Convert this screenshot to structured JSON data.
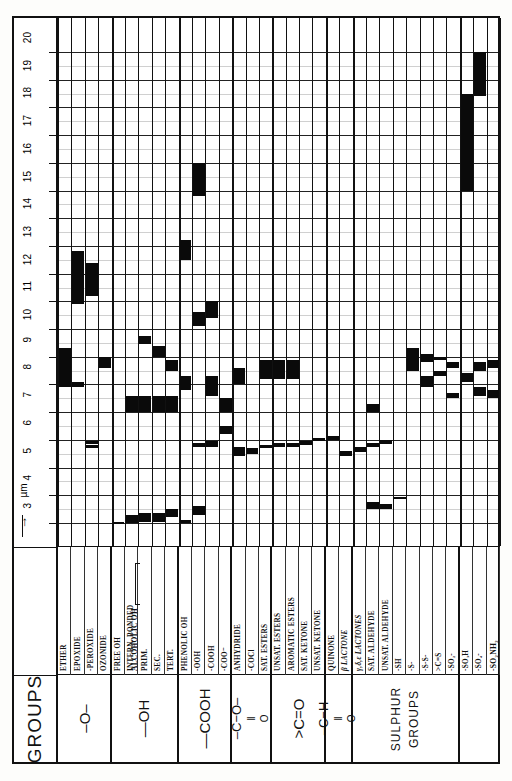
{
  "axis": {
    "unit_label": "µm",
    "arrow": "→",
    "min": 3,
    "max": 20,
    "ticks": [
      3,
      4,
      5,
      6,
      7,
      8,
      9,
      10,
      11,
      12,
      13,
      14,
      15,
      16,
      17,
      18,
      19,
      20
    ]
  },
  "row_header": "GROUPS",
  "families": [
    {
      "id": "ether",
      "label": "–O–",
      "style": "big",
      "cols": 4
    },
    {
      "id": "hydroxyl",
      "label": "—OH",
      "style": "big",
      "cols": 5
    },
    {
      "id": "carboxyl",
      "label": "—COOH",
      "style": "big",
      "cols": 4
    },
    {
      "id": "ester",
      "label": "ESTER",
      "style": "formula-ester",
      "cols": 3
    },
    {
      "id": "ketone",
      "label": ">C=O",
      "style": "big",
      "cols": 4
    },
    {
      "id": "aldehyde",
      "label": "ALDEHYDE",
      "style": "formula-aldehyde",
      "cols": 2
    },
    {
      "id": "sulphur",
      "label": "SULPHUR GROUPS",
      "style": "small",
      "cols": 8
    }
  ],
  "columns": [
    {
      "id": "ether",
      "label": "ETHER",
      "family": "ether"
    },
    {
      "id": "epoxide",
      "label": "EPOXIDE",
      "family": "ether"
    },
    {
      "id": "peroxide",
      "label": "-PEROXIDE",
      "family": "ether"
    },
    {
      "id": "ozonide",
      "label": "OZONIDE",
      "family": "ether"
    },
    {
      "id": "free-oh",
      "label": "FREE OH",
      "family": "hydroxyl"
    },
    {
      "id": "intern-bonded",
      "label": "INTERN. BONDED",
      "family": "hydroxyl"
    },
    {
      "id": "alcoholic-prim",
      "label": "PRIM.",
      "family": "hydroxyl",
      "group": "ALCOHOLIC OH"
    },
    {
      "id": "alcoholic-sec",
      "label": "SEC.",
      "family": "hydroxyl",
      "group": "ALCOHOLIC OH"
    },
    {
      "id": "alcoholic-tert",
      "label": "TERT.",
      "family": "hydroxyl",
      "group": "ALCOHOLIC OH"
    },
    {
      "id": "phenolic-oh",
      "label": "PHENOLIC OH",
      "family": "carboxyl"
    },
    {
      "id": "ooh",
      "label": "-OOH",
      "family": "carboxyl"
    },
    {
      "id": "cooh",
      "label": "-COOH",
      "family": "carboxyl"
    },
    {
      "id": "coo-minus",
      "label": "-COO⁻",
      "family": "carboxyl"
    },
    {
      "id": "anhydride",
      "label": "ANHYDRIDE",
      "family": "carboxyl"
    },
    {
      "id": "cocl",
      "label": "-COCl",
      "family": "carboxyl"
    },
    {
      "id": "sat-esters",
      "label": "SAT. ESTERS",
      "family": "ester"
    },
    {
      "id": "unsat-esters",
      "label": "UNSAT. ESTERS",
      "family": "ester"
    },
    {
      "id": "aromatic-esters",
      "label": "AROMATIC ESTERS",
      "family": "ester"
    },
    {
      "id": "sat-ketone",
      "label": "SAT. KETONE",
      "family": "ketone"
    },
    {
      "id": "unsat-ketone",
      "label": "UNSAT. KETONE",
      "family": "ketone"
    },
    {
      "id": "quinone",
      "label": "QUINONE",
      "family": "ketone"
    },
    {
      "id": "beta-lactone",
      "label": "β LACTONE",
      "family": "ketone",
      "italic": true
    },
    {
      "id": "gde-lactones",
      "label": "γ,δ,ε LACTONES",
      "family": "ketone",
      "italic": true
    },
    {
      "id": "sat-aldehyde",
      "label": "SAT. ALDEHYDE",
      "family": "aldehyde"
    },
    {
      "id": "unsat-aldehyde",
      "label": "UNSAT. ALDEHYDE",
      "family": "aldehyde"
    },
    {
      "id": "sh",
      "label": "-SH",
      "family": "sulphur"
    },
    {
      "id": "s",
      "label": "-S-",
      "family": "sulphur"
    },
    {
      "id": "ss",
      "label": "-S-S-",
      "family": "sulphur"
    },
    {
      "id": "cs",
      "label": ">C=S",
      "family": "sulphur"
    },
    {
      "id": "so2",
      "label": "-SO₂-",
      "family": "sulphur"
    },
    {
      "id": "so3h",
      "label": "-SO₃H",
      "family": "sulphur"
    },
    {
      "id": "so4",
      "label": "-SO₄-",
      "family": "sulphur"
    },
    {
      "id": "so2nh2",
      "label": "-SO₂NH₂",
      "family": "sulphur",
      "bold": true
    }
  ],
  "chart_data": {
    "type": "bar",
    "xlabel": "GROUPS",
    "ylabel": "µm",
    "ylim": [
      3,
      20
    ],
    "grid": true,
    "orientation": "vertical-columns",
    "note": "Each column is a functional group; filled black segments mark the wavelength ranges (in micrometres) at which that group absorbs.",
    "bands": [
      {
        "col": "ether",
        "ranges": [
          [
            7.9,
            9.3
          ]
        ]
      },
      {
        "col": "epoxide",
        "ranges": [
          [
            7.9,
            8.1
          ],
          [
            10.9,
            12.8
          ]
        ]
      },
      {
        "col": "peroxide",
        "ranges": [
          [
            5.7,
            5.8
          ],
          [
            5.85,
            5.95
          ],
          [
            11.2,
            12.4
          ]
        ]
      },
      {
        "col": "ozonide",
        "ranges": [
          [
            8.6,
            9.0
          ]
        ]
      },
      {
        "col": "free-oh",
        "ranges": [
          [
            2.95,
            3.05
          ]
        ]
      },
      {
        "col": "intern-bonded",
        "ranges": [
          [
            3.0,
            3.3
          ],
          [
            7.0,
            7.6
          ]
        ]
      },
      {
        "col": "alcoholic-prim",
        "ranges": [
          [
            3.05,
            3.35
          ],
          [
            7.0,
            7.6
          ],
          [
            9.45,
            9.75
          ]
        ]
      },
      {
        "col": "alcoholic-sec",
        "ranges": [
          [
            3.05,
            3.35
          ],
          [
            7.0,
            7.6
          ],
          [
            9.0,
            9.4
          ]
        ]
      },
      {
        "col": "alcoholic-tert",
        "ranges": [
          [
            3.2,
            3.5
          ],
          [
            7.0,
            7.6
          ],
          [
            8.5,
            8.9
          ]
        ]
      },
      {
        "col": "phenolic-oh",
        "ranges": [
          [
            2.95,
            3.1
          ],
          [
            7.8,
            8.3
          ],
          [
            12.5,
            13.2
          ]
        ]
      },
      {
        "col": "ooh",
        "ranges": [
          [
            3.3,
            3.6
          ],
          [
            5.75,
            5.9
          ],
          [
            10.1,
            10.6
          ],
          [
            14.8,
            16.0
          ]
        ]
      },
      {
        "col": "cooh",
        "ranges": [
          [
            5.75,
            5.95
          ],
          [
            7.6,
            8.3
          ],
          [
            10.4,
            11.0
          ]
        ]
      },
      {
        "col": "coo-minus",
        "ranges": [
          [
            6.2,
            6.5
          ],
          [
            7.0,
            7.5
          ]
        ]
      },
      {
        "col": "anhydride",
        "ranges": [
          [
            5.4,
            5.75
          ],
          [
            8.0,
            8.6
          ]
        ]
      },
      {
        "col": "cocl",
        "ranges": [
          [
            5.5,
            5.7
          ]
        ]
      },
      {
        "col": "sat-esters",
        "ranges": [
          [
            5.7,
            5.8
          ],
          [
            8.2,
            8.9
          ]
        ]
      },
      {
        "col": "unsat-esters",
        "ranges": [
          [
            5.75,
            5.9
          ],
          [
            8.2,
            8.9
          ]
        ]
      },
      {
        "col": "aromatic-esters",
        "ranges": [
          [
            5.75,
            5.9
          ],
          [
            8.2,
            8.9
          ]
        ]
      },
      {
        "col": "sat-ketone",
        "ranges": [
          [
            5.8,
            5.95
          ]
        ]
      },
      {
        "col": "unsat-ketone",
        "ranges": [
          [
            5.95,
            6.05
          ]
        ]
      },
      {
        "col": "quinone",
        "ranges": [
          [
            6.0,
            6.15
          ]
        ]
      },
      {
        "col": "beta-lactone",
        "ranges": [
          [
            5.4,
            5.6
          ]
        ]
      },
      {
        "col": "gde-lactones",
        "ranges": [
          [
            5.55,
            5.75
          ]
        ]
      },
      {
        "col": "sat-aldehyde",
        "ranges": [
          [
            3.5,
            3.75
          ],
          [
            5.75,
            5.9
          ],
          [
            7.0,
            7.3
          ]
        ]
      },
      {
        "col": "unsat-aldehyde",
        "ranges": [
          [
            3.5,
            3.7
          ],
          [
            5.85,
            6.0
          ]
        ]
      },
      {
        "col": "sh",
        "ranges": [
          [
            3.85,
            3.95
          ]
        ]
      },
      {
        "col": "s",
        "ranges": [
          [
            8.5,
            9.3
          ]
        ]
      },
      {
        "col": "ss",
        "ranges": [
          [
            7.9,
            8.3
          ],
          [
            8.8,
            9.1
          ]
        ]
      },
      {
        "col": "cs",
        "ranges": [
          [
            8.3,
            8.5
          ],
          [
            8.9,
            9.0
          ]
        ]
      },
      {
        "col": "so2",
        "ranges": [
          [
            7.5,
            7.7
          ],
          [
            8.6,
            8.8
          ]
        ]
      },
      {
        "col": "so3h",
        "ranges": [
          [
            8.1,
            8.4
          ],
          [
            15.0,
            18.5
          ]
        ]
      },
      {
        "col": "so4",
        "ranges": [
          [
            7.6,
            7.9
          ],
          [
            8.5,
            8.8
          ],
          [
            18.4,
            20.5
          ]
        ]
      },
      {
        "col": "so2nh2",
        "ranges": [
          [
            7.5,
            7.8
          ],
          [
            8.6,
            8.9
          ]
        ]
      }
    ]
  }
}
